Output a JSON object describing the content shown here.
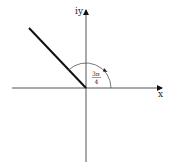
{
  "diagram": {
    "title": "",
    "axes": {
      "x_label": "x",
      "y_label": "iy"
    },
    "angle": {
      "numerator": "3π",
      "denominator": "4",
      "value_radians": "3π/4"
    },
    "colors": {
      "axis": "#555555",
      "ray": "#111111",
      "arc": "#555555",
      "text": "#222222"
    }
  }
}
